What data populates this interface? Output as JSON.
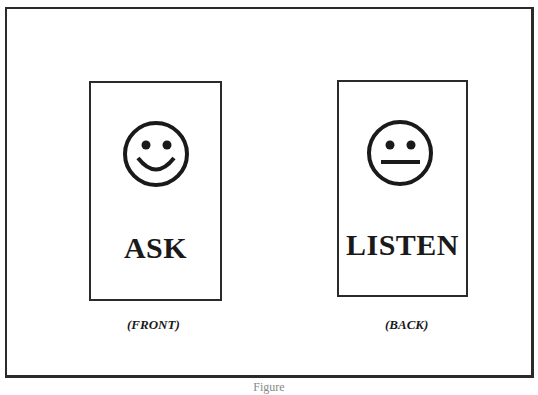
{
  "figure": {
    "cards": [
      {
        "side_label": "(FRONT)",
        "word": "ASK",
        "face": "smiley-face-icon"
      },
      {
        "side_label": "(BACK)",
        "word": "LISTEN",
        "face": "neutral-face-icon"
      }
    ],
    "caption": "Figure"
  },
  "colors": {
    "ink": "#1a1a1a",
    "background": "#ffffff"
  }
}
